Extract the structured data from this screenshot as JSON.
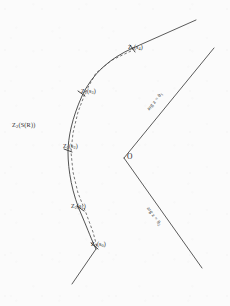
{
  "figure": {
    "background_color": "#fbfbfb",
    "ink_color": "#3a3a3a",
    "curve_label": "Z(S(R))",
    "curve_label_base": "Z",
    "curve_label_sub": "2",
    "curve_label_rest": "(S(R))",
    "origin_label": "O"
  },
  "points": [
    {
      "id": "p0",
      "base": "Z",
      "sub": "2",
      "arg": "(s",
      "argsub": "0",
      "close": ")",
      "text": "Z2(s0)"
    },
    {
      "id": "p1",
      "base": "Z",
      "sub": "2",
      "arg": "(s",
      "argsub": "1",
      "close": ")",
      "text": "Z2(s1)"
    },
    {
      "id": "p2",
      "base": "Z",
      "sub": "2",
      "arg": "(s",
      "argsub": "2",
      "close": ")",
      "text": "Z2(s2)"
    },
    {
      "id": "p3",
      "base": "Z",
      "sub": "2",
      "arg": "(s",
      "argsub": "3",
      "close": ")",
      "text": "Z2(s3)"
    },
    {
      "id": "p4",
      "base": "Z",
      "sub": "2",
      "arg": "(s",
      "argsub": "4",
      "close": ")",
      "text": "Z2(s4)"
    }
  ],
  "rays": {
    "upper": {
      "label_prefix": "arg z = ",
      "label_value": "θ",
      "label_sub": "1",
      "text": "arg z = θ1"
    },
    "lower": {
      "label_prefix": "arg z = ",
      "label_value": "θ",
      "label_sub": "2",
      "text": "arg z = θ2"
    }
  },
  "geometry": {
    "origin": {
      "x": 124,
      "y": 158
    },
    "upper_ray_end": {
      "x": 214,
      "y": 48
    },
    "lower_ray_end": {
      "x": 202,
      "y": 268
    },
    "curve_tangent_start": {
      "x": 196,
      "y": 20
    },
    "curve_tangent_end": {
      "x": 72,
      "y": 284
    }
  }
}
